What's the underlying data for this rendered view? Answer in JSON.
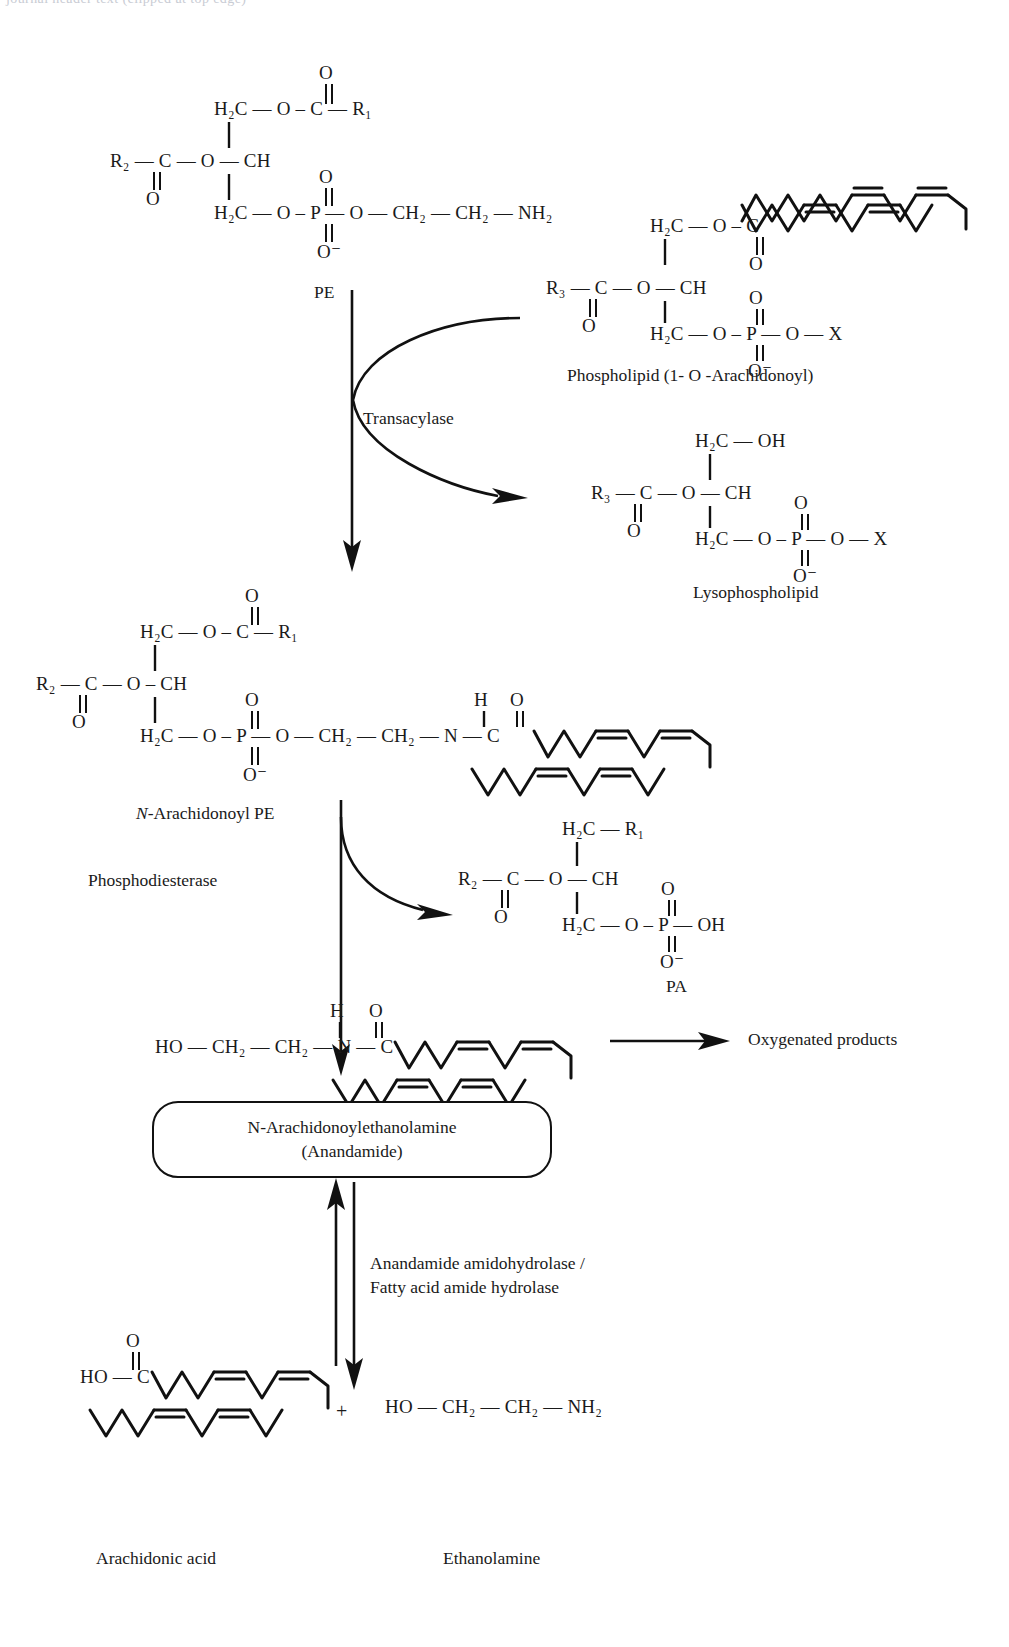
{
  "figure": {
    "type": "biochemical-pathway-diagram",
    "title_cut_off_top": "journal header text (clipped at top edge)"
  },
  "structures": {
    "pe": {
      "label": "PE",
      "rows": {
        "top_carbonyl_o": "O",
        "line1": "H₂C — O – C — R₁",
        "line2": "R₂ — C — O — CH",
        "line2_carbonyl_o": "O",
        "phosphate_top_o": "O",
        "line3": "H₂C — O – P — O — CH₂ — CH₂ —NH₂",
        "phosphate_bottom_o": "O⁻"
      },
      "tokens": {
        "h2c": "H₂C",
        "o": "O",
        "c": "C",
        "r1": "R₁",
        "r2": "R₂",
        "ch": "CH",
        "p": "P",
        "ch2": "CH₂",
        "nh2": "NH₂",
        "ominus": "O⁻"
      }
    },
    "phospholipid": {
      "label": "Phospholipid (1- O -Arachidonoyl)",
      "tokens": {
        "h2c": "H₂C",
        "o": "O",
        "c": "C",
        "r3": "R₃",
        "ch": "CH",
        "p": "P",
        "x": "X",
        "ominus": "O⁻"
      }
    },
    "lysophospholipid": {
      "label": "Lysophospholipid",
      "tokens": {
        "h2c": "H₂C",
        "oh": "OH",
        "o": "O",
        "c": "C",
        "r3": "R₃",
        "ch": "CH",
        "p": "P",
        "x": "X",
        "ominus": "O⁻"
      }
    },
    "n_arachidonoyl_pe": {
      "label_italic": "N",
      "label_rest": "-Arachidonoyl PE",
      "tokens": {
        "h2c": "H₂C",
        "o": "O",
        "c": "C",
        "r1": "R₁",
        "r2": "R₂",
        "ch": "CH",
        "p": "P",
        "ch2": "CH₂",
        "n": "N",
        "h": "H",
        "ominus": "O⁻"
      }
    },
    "pa": {
      "label": "PA",
      "tokens": {
        "h2c": "H₂C",
        "o": "O",
        "c": "C",
        "r1": "R₁",
        "r2": "R₂",
        "ch": "CH",
        "p": "P",
        "oh": "OH",
        "ominus": "O⁻"
      }
    },
    "anandamide_chain": {
      "tokens": {
        "ho": "HO",
        "ch2": "CH₂",
        "n": "N",
        "h": "H",
        "o": "O",
        "c": "C"
      }
    },
    "arachidonic_acid": {
      "label": "Arachidonic acid",
      "tokens": {
        "ho": "HO",
        "c": "C",
        "o": "O"
      }
    },
    "ethanolamine": {
      "label": "Ethanolamine",
      "tokens": {
        "ho": "HO",
        "ch2": "CH₂",
        "nh2": "NH₂"
      }
    }
  },
  "enzymes": {
    "transacylase": "Transacylase",
    "phosphodiesterase": "Phosphodiesterase",
    "amidohydrolase_line1": "Anandamide amidohydrolase /",
    "amidohydrolase_line2": "Fatty acid amide hydrolase"
  },
  "boxes": {
    "anandamide_line1": "N-Arachidonoylethanolamine",
    "anandamide_line2": "(Anandamide)"
  },
  "products": {
    "oxygenated": "Oxygenated products",
    "plus_sign": "+"
  },
  "colors": {
    "ink": "#1a1a1a",
    "stroke": "#111111",
    "background": "#ffffff"
  }
}
